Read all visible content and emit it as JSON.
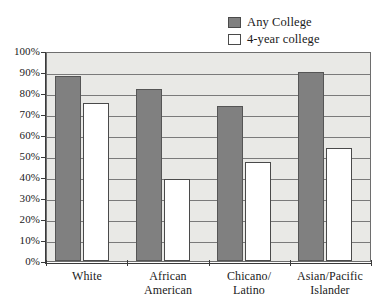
{
  "chart_data": {
    "type": "bar",
    "title": "",
    "xlabel": "",
    "ylabel": "",
    "ylim": [
      0,
      100
    ],
    "grid": true,
    "legend_position": "top-right",
    "categories": [
      "White",
      "African American",
      "Chicano/Latino",
      "Asian/Pacific Islander"
    ],
    "category_lines": [
      [
        "White"
      ],
      [
        "African",
        "American"
      ],
      [
        "Chicano/",
        "Latino"
      ],
      [
        "Asian/Pacific",
        "Islander"
      ]
    ],
    "ytick_labels": [
      "100%",
      "90%",
      "80%",
      "70%",
      "60%",
      "50%",
      "40%",
      "30%",
      "20%",
      "10%",
      "0%"
    ],
    "ytick_values": [
      100,
      90,
      80,
      70,
      60,
      50,
      40,
      30,
      20,
      10,
      0
    ],
    "series": [
      {
        "name": "Any College",
        "color": "#808080",
        "values": [
          88,
          82,
          74,
          90
        ]
      },
      {
        "name": "4-year college",
        "color": "#ffffff",
        "values": [
          75,
          39,
          47,
          54
        ]
      }
    ]
  },
  "legend": {
    "items": [
      {
        "label": "Any College",
        "swatch": "filled"
      },
      {
        "label": "4-year college",
        "swatch": "hollow"
      }
    ]
  },
  "colors": {
    "any_college_fill": "#808080",
    "four_year_fill": "#ffffff",
    "plot_background": "#e9e9e6",
    "gridline": "#7a7a7a",
    "axis": "#3a3a3a"
  }
}
